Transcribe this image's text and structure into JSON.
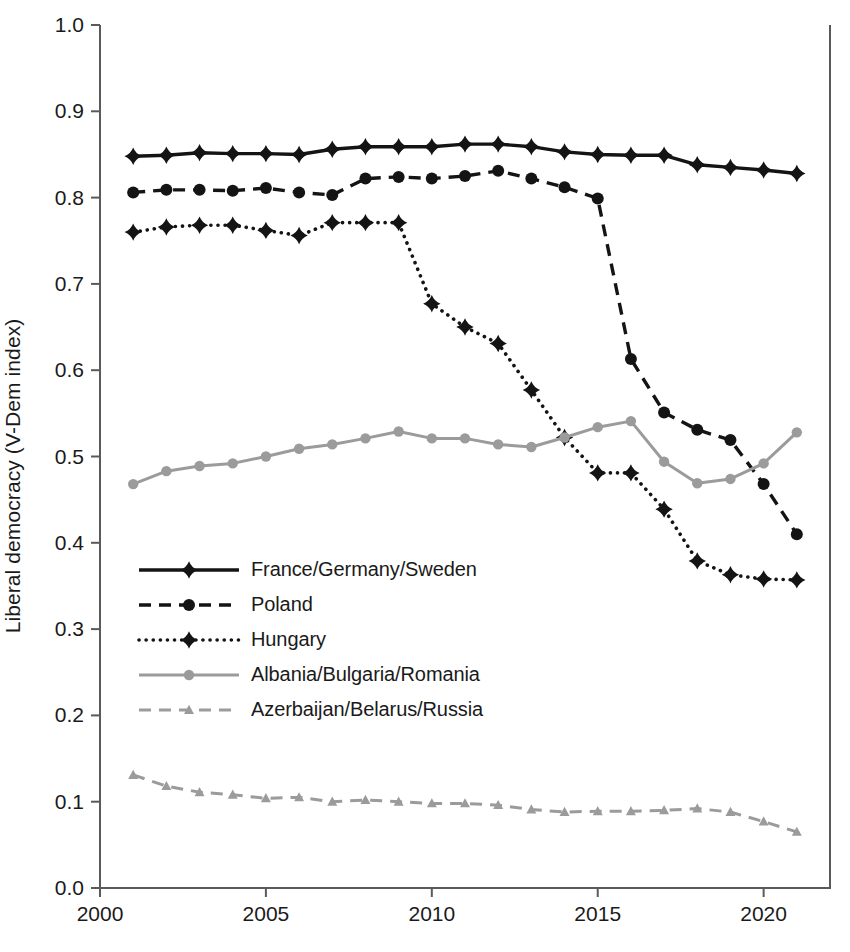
{
  "chart_data": {
    "type": "line",
    "title": "",
    "xlabel": "",
    "ylabel": "Liberal democracy (V-Dem index)",
    "xlim": [
      2000,
      2022
    ],
    "ylim": [
      0.0,
      1.0
    ],
    "grid": false,
    "legend_position": "inside-left-middle",
    "x_ticks": [
      "2000",
      "2005",
      "2010",
      "2015",
      "2020"
    ],
    "x_tick_values": [
      2000,
      2005,
      2010,
      2015,
      2020
    ],
    "y_ticks": [
      "0.0",
      "0.1",
      "0.2",
      "0.3",
      "0.4",
      "0.5",
      "0.6",
      "0.7",
      "0.8",
      "0.9",
      "1.0"
    ],
    "y_tick_values": [
      0.0,
      0.1,
      0.2,
      0.3,
      0.4,
      0.5,
      0.6,
      0.7,
      0.8,
      0.9,
      1.0
    ],
    "x": [
      2001,
      2002,
      2003,
      2004,
      2005,
      2006,
      2007,
      2008,
      2009,
      2010,
      2011,
      2012,
      2013,
      2014,
      2015,
      2016,
      2017,
      2018,
      2019,
      2020,
      2021
    ],
    "series": [
      {
        "name": "France/Germany/Sweden",
        "color": "#141414",
        "dash": "solid",
        "marker": "diamond",
        "values": [
          0.848,
          0.849,
          0.852,
          0.851,
          0.851,
          0.85,
          0.856,
          0.859,
          0.859,
          0.859,
          0.862,
          0.862,
          0.859,
          0.853,
          0.85,
          0.849,
          0.849,
          0.838,
          0.835,
          0.832,
          0.828
        ]
      },
      {
        "name": "Poland",
        "color": "#141414",
        "dash": "dashed",
        "marker": "circle",
        "values": [
          0.806,
          0.809,
          0.809,
          0.808,
          0.811,
          0.806,
          0.803,
          0.822,
          0.824,
          0.822,
          0.825,
          0.831,
          0.822,
          0.812,
          0.799,
          0.613,
          0.551,
          0.531,
          0.519,
          0.468,
          0.41
        ]
      },
      {
        "name": "Hungary",
        "color": "#141414",
        "dash": "dotted",
        "marker": "diamond",
        "values": [
          0.76,
          0.766,
          0.768,
          0.768,
          0.762,
          0.756,
          0.771,
          0.771,
          0.771,
          0.677,
          0.65,
          0.631,
          0.577,
          0.522,
          0.481,
          0.481,
          0.439,
          0.379,
          0.363,
          0.358,
          0.357
        ]
      },
      {
        "name": "Albania/Bulgaria/Romania",
        "color": "#9b9b9b",
        "dash": "solid",
        "marker": "circle",
        "values": [
          0.468,
          0.483,
          0.489,
          0.492,
          0.5,
          0.509,
          0.514,
          0.521,
          0.529,
          0.521,
          0.521,
          0.514,
          0.511,
          0.522,
          0.534,
          0.541,
          0.494,
          0.469,
          0.474,
          0.492,
          0.528
        ]
      },
      {
        "name": "Azerbaijan/Belarus/Russia",
        "color": "#9b9b9b",
        "dash": "dashed",
        "marker": "triangle",
        "values": [
          0.131,
          0.118,
          0.111,
          0.108,
          0.104,
          0.105,
          0.1,
          0.102,
          0.1,
          0.098,
          0.098,
          0.096,
          0.091,
          0.088,
          0.089,
          0.089,
          0.09,
          0.092,
          0.088,
          0.077,
          0.065
        ]
      }
    ]
  }
}
